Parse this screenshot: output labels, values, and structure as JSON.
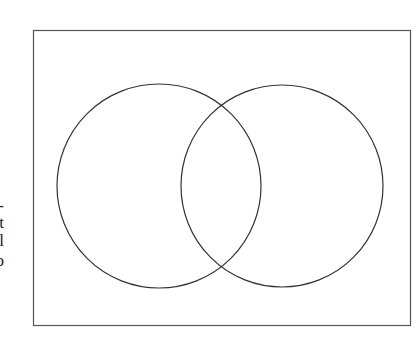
{
  "diagram": {
    "type": "venn",
    "sets": 2,
    "frame": {
      "x": 33,
      "y": 30,
      "width": 377,
      "height": 295,
      "stroke": "#555555"
    },
    "circles": [
      {
        "name": "left",
        "cx": 159,
        "cy": 186,
        "r": 102,
        "stroke": "#333333"
      },
      {
        "name": "right",
        "cx": 282,
        "cy": 186,
        "r": 101,
        "stroke": "#333333"
      }
    ]
  },
  "cropped_text_fragments": [
    "-",
    "t",
    "l",
    "o"
  ]
}
